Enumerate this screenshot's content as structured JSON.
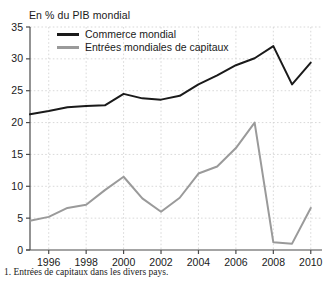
{
  "chart_data": {
    "type": "line",
    "title": "En % du PIB mondial",
    "xlabel": "",
    "ylabel": "",
    "xlim": [
      1995,
      2010.6
    ],
    "ylim": [
      0,
      35
    ],
    "yticks": [
      0,
      5,
      10,
      15,
      20,
      25,
      30,
      35
    ],
    "xticks": [
      1996,
      1998,
      2000,
      2002,
      2004,
      2006,
      2008,
      2010
    ],
    "grid": true,
    "legend_position": "top-left",
    "x": [
      1995,
      1996,
      1997,
      1998,
      1999,
      2000,
      2001,
      2002,
      2003,
      2004,
      2005,
      2006,
      2007,
      2008,
      2009,
      2010
    ],
    "series": [
      {
        "name": "Commerce mondial",
        "color": "#1a1a1a",
        "values": [
          21.3,
          21.8,
          22.4,
          22.6,
          22.7,
          24.5,
          23.8,
          23.6,
          24.2,
          26.0,
          27.4,
          29.0,
          30.1,
          32.0,
          26.0,
          29.4
        ]
      },
      {
        "name": "Entrées mondiales de capitaux",
        "color": "#9a9a9a",
        "values": [
          4.6,
          5.2,
          6.6,
          7.1,
          9.4,
          11.5,
          8.1,
          6.0,
          8.2,
          12.0,
          13.1,
          16.0,
          20.0,
          1.2,
          1.0,
          6.6
        ]
      }
    ],
    "tick_labels": {
      "y": [
        "0",
        "5",
        "10",
        "15",
        "20",
        "25",
        "30",
        "35"
      ],
      "x": [
        "1996",
        "1998",
        "2000",
        "2002",
        "2004",
        "2006",
        "2008",
        "2010"
      ]
    }
  },
  "legend": {
    "items": [
      {
        "label": "Commerce mondial",
        "color": "#1a1a1a"
      },
      {
        "label": "Entrées mondiales de capitaux",
        "color": "#9a9a9a"
      }
    ]
  },
  "footnote": {
    "text": "1. Entrées de capitaux dans les divers pays."
  },
  "colors": {
    "axis": "#4a4a4a",
    "grid": "#cfcfcf",
    "background": "#ffffff",
    "text": "#1a1a1a"
  }
}
